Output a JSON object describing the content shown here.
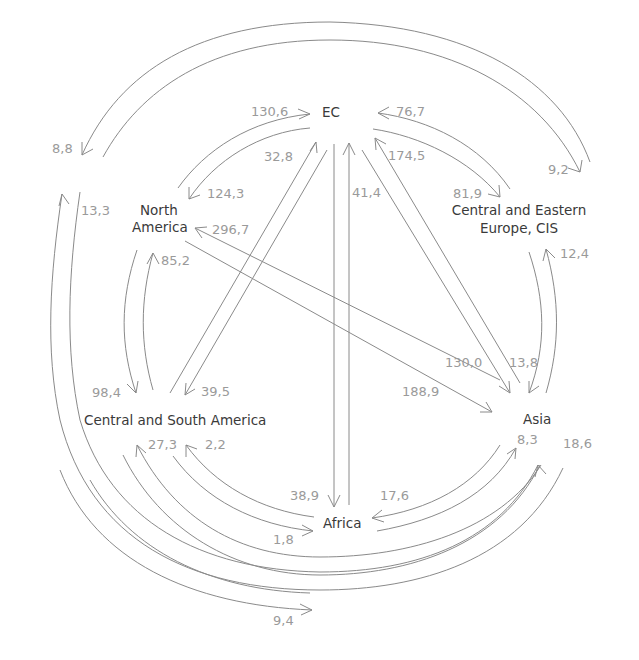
{
  "diagram": {
    "colors": {
      "line": "#8a8a8a",
      "region_text": "#3a3a3a",
      "value_text": "#9a9a9a",
      "background": "#ffffff"
    },
    "regions": {
      "ec": "EC",
      "north_america_1": "North",
      "north_america_2": "America",
      "ceec_1": "Central and Eastern",
      "ceec_2": "Europe, CIS",
      "csa": "Central and South America",
      "asia": "Asia",
      "africa": "Africa"
    },
    "flows": [
      {
        "id": "na_to_ec",
        "from": "North America",
        "to": "EC",
        "value": "130,6"
      },
      {
        "id": "ec_to_na",
        "from": "EC",
        "to": "North America",
        "value": "124,3"
      },
      {
        "id": "csa_to_ec",
        "from": "Central and South America",
        "to": "EC",
        "value": "32,8"
      },
      {
        "id": "ec_to_csa",
        "from": "EC",
        "to": "Central and South America",
        "value": "39,5"
      },
      {
        "id": "ceec_to_ec",
        "from": "Central and Eastern Europe, CIS",
        "to": "EC",
        "value": "76,7"
      },
      {
        "id": "ec_to_ceec",
        "from": "EC",
        "to": "Central and Eastern Europe, CIS",
        "value": "81,9"
      },
      {
        "id": "asia_to_ec",
        "from": "Asia",
        "to": "EC",
        "value": "174,5"
      },
      {
        "id": "ec_to_asia",
        "from": "EC",
        "to": "Asia",
        "value": "130,0"
      },
      {
        "id": "africa_to_ec",
        "from": "Africa",
        "to": "EC",
        "value": "41,4"
      },
      {
        "id": "ec_to_africa",
        "from": "EC",
        "to": "Africa",
        "value": "38,9"
      },
      {
        "id": "asia_to_na",
        "from": "Asia",
        "to": "North America",
        "value": "296,7"
      },
      {
        "id": "na_to_asia",
        "from": "North America",
        "to": "Asia",
        "value": "188,9"
      },
      {
        "id": "na_to_csa",
        "from": "North America",
        "to": "Central and South America",
        "value": "98,4"
      },
      {
        "id": "csa_to_na",
        "from": "Central and South America",
        "to": "North America",
        "value": "85,2"
      },
      {
        "id": "ceec_to_asia",
        "from": "Central and Eastern Europe, CIS",
        "to": "Asia",
        "value": "13,8"
      },
      {
        "id": "asia_to_ceec",
        "from": "Asia",
        "to": "Central and Eastern Europe, CIS",
        "value": "12,4"
      },
      {
        "id": "ceec_to_na",
        "from": "Central and Eastern Europe, CIS",
        "to": "North America",
        "value": "8,8"
      },
      {
        "id": "na_to_ceec",
        "from": "North America",
        "to": "Central and Eastern Europe, CIS",
        "value": "9,2"
      },
      {
        "id": "asia_to_na_outer",
        "from": "Asia",
        "to": "North America",
        "value": "13,3"
      },
      {
        "id": "na_to_asia_outer",
        "from": "North America",
        "to": "Asia",
        "value": "18,6"
      },
      {
        "id": "africa_to_csa",
        "from": "Africa",
        "to": "Central and South America",
        "value": "2,2"
      },
      {
        "id": "csa_to_africa",
        "from": "Central and South America",
        "to": "Africa",
        "value": "1,8"
      },
      {
        "id": "asia_to_csa",
        "from": "Asia",
        "to": "Central and South America",
        "value": "27,3"
      },
      {
        "id": "csa_to_asia",
        "from": "Central and South America",
        "to": "Asia",
        "value": "8,3"
      },
      {
        "id": "africa_to_asia",
        "from": "Africa",
        "to": "Asia",
        "value": "17,6"
      },
      {
        "id": "na_to_africa",
        "from": "North America",
        "to": "Africa",
        "value": "9,4"
      }
    ],
    "labels": {
      "v130_6": "130,6",
      "v124_3": "124,3",
      "v32_8": "32,8",
      "v39_5": "39,5",
      "v76_7": "76,7",
      "v81_9": "81,9",
      "v174_5": "174,5",
      "v130_0": "130,0",
      "v41_4": "41,4",
      "v38_9": "38,9",
      "v296_7": "296,7",
      "v188_9": "188,9",
      "v98_4": "98,4",
      "v85_2": "85,2",
      "v13_8": "13,8",
      "v12_4": "12,4",
      "v8_8": "8,8",
      "v9_2": "9,2",
      "v13_3": "13,3",
      "v18_6": "18,6",
      "v2_2": "2,2",
      "v1_8": "1,8",
      "v27_3": "27,3",
      "v8_3": "8,3",
      "v17_6": "17,6",
      "v9_4": "9,4"
    }
  }
}
